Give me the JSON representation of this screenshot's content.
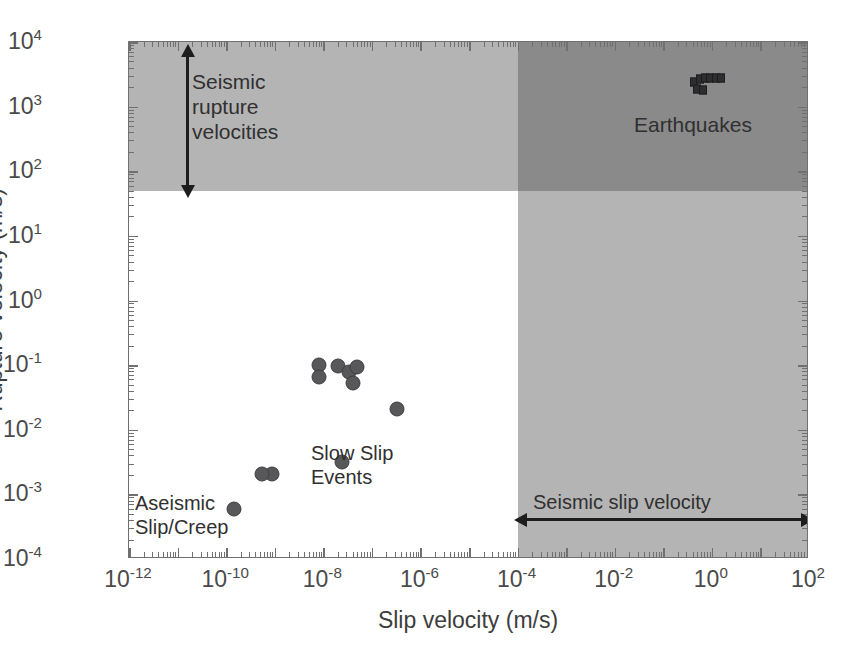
{
  "chart_data": {
    "type": "scatter",
    "title": "",
    "xlabel": "Slip velocity (m/s)",
    "ylabel": "Rupture velocity (m/s)",
    "xscale": "log",
    "yscale": "log",
    "xlim": [
      1e-12,
      100.0
    ],
    "ylim": [
      0.0001,
      10000.0
    ],
    "grid": false,
    "legend": "none",
    "xticks": [
      "10-12",
      "10-10",
      "10-8",
      "10-6",
      "10-4",
      "10-2",
      "100",
      "102"
    ],
    "xtick_labels": [
      {
        "mantissa": "10",
        "exponent": "-12",
        "log10": -12
      },
      {
        "mantissa": "10",
        "exponent": "-10",
        "log10": -10
      },
      {
        "mantissa": "10",
        "exponent": "-8",
        "log10": -8
      },
      {
        "mantissa": "10",
        "exponent": "-6",
        "log10": -6
      },
      {
        "mantissa": "10",
        "exponent": "-4",
        "log10": -4
      },
      {
        "mantissa": "10",
        "exponent": "-2",
        "log10": -2
      },
      {
        "mantissa": "10",
        "exponent": "0",
        "log10": 0
      },
      {
        "mantissa": "10",
        "exponent": "2",
        "log10": 2
      }
    ],
    "ytick_labels": [
      {
        "mantissa": "10",
        "exponent": "4",
        "log10": 4
      },
      {
        "mantissa": "10",
        "exponent": "3",
        "log10": 3
      },
      {
        "mantissa": "10",
        "exponent": "2",
        "log10": 2
      },
      {
        "mantissa": "10",
        "exponent": "1",
        "log10": 1
      },
      {
        "mantissa": "10",
        "exponent": "0",
        "log10": 0
      },
      {
        "mantissa": "10",
        "exponent": "-1",
        "log10": -1
      },
      {
        "mantissa": "10",
        "exponent": "-2",
        "log10": -2
      },
      {
        "mantissa": "10",
        "exponent": "-3",
        "log10": -3
      },
      {
        "mantissa": "10",
        "exponent": "-4",
        "log10": -4
      }
    ],
    "series": [
      {
        "name": "Slow Slip Events",
        "marker": "circle",
        "color": "#58585a",
        "points": [
          {
            "x_log10": -8.09,
            "y_log10": -1.0
          },
          {
            "x_log10": -8.09,
            "y_log10": -1.19
          },
          {
            "x_log10": -7.7,
            "y_log10": -1.02
          },
          {
            "x_log10": -7.47,
            "y_log10": -1.1
          },
          {
            "x_log10": -7.31,
            "y_log10": -1.03
          },
          {
            "x_log10": -7.39,
            "y_log10": -1.28
          },
          {
            "x_log10": -6.48,
            "y_log10": -1.68
          },
          {
            "x_log10": -7.61,
            "y_log10": -2.5
          },
          {
            "x_log10": -9.05,
            "y_log10": -2.69
          },
          {
            "x_log10": -9.26,
            "y_log10": -2.68
          },
          {
            "x_log10": -9.84,
            "y_log10": -3.23
          }
        ]
      },
      {
        "name": "Earthquakes",
        "marker": "square",
        "color": "#2e2e30",
        "points": [
          {
            "x_log10": -0.37,
            "y_log10": 3.38
          },
          {
            "x_log10": -0.25,
            "y_log10": 3.43
          },
          {
            "x_log10": -0.15,
            "y_log10": 3.45
          },
          {
            "x_log10": -0.04,
            "y_log10": 3.45
          },
          {
            "x_log10": 0.08,
            "y_log10": 3.45
          },
          {
            "x_log10": 0.19,
            "y_log10": 3.44
          },
          {
            "x_log10": -0.31,
            "y_log10": 3.27
          },
          {
            "x_log10": -0.19,
            "y_log10": 3.26
          }
        ]
      }
    ],
    "regions": [
      {
        "name": "seismic-rupture-velocity-band",
        "orientation": "horizontal",
        "y_range_log10": [
          1.69,
          4
        ],
        "color": "#b4b4b4",
        "label": "Seismic\nrupture\nvelocities"
      },
      {
        "name": "seismic-slip-velocity-band",
        "orientation": "vertical",
        "x_range_log10": [
          -4,
          2
        ],
        "color": "#b4b4b4",
        "label": "Seismic slip velocity"
      },
      {
        "name": "overlap-band",
        "orientation": "both",
        "x_range_log10": [
          -4,
          2
        ],
        "y_range_log10": [
          1.69,
          4
        ],
        "color": "#8a8a8a",
        "label": ""
      }
    ],
    "annotations": [
      {
        "name": "seismic-rupture-velocities",
        "text": "Seismic\nrupture\nvelocities",
        "x_log10": -10.6,
        "y_log10": 3.0
      },
      {
        "name": "earthquakes",
        "text": "Earthquakes",
        "x_log10": -0.9,
        "y_log10": 2.6
      },
      {
        "name": "slow-slip-events",
        "text": "Slow Slip\nEvents",
        "x_log10": -8.2,
        "y_log10": -1.9
      },
      {
        "name": "aseismic-slip-creep",
        "text": "Aseismic\nSlip/Creep",
        "x_log10": -11.5,
        "y_log10": -2.7
      },
      {
        "name": "seismic-slip-velocity",
        "text": "Seismic slip velocity",
        "x_log10": -1.0,
        "y_log10": -2.65
      }
    ],
    "arrows": [
      {
        "name": "rupture-velocity-range-arrow",
        "orientation": "vertical",
        "double_headed": true,
        "x_log10": -10.8,
        "y_start_log10": 1.75,
        "y_end_log10": 3.78
      },
      {
        "name": "slip-velocity-range-arrow",
        "orientation": "horizontal",
        "double_headed": true,
        "y_log10": -3.15,
        "x_start_log10": -3.9,
        "x_end_log10": 1.8
      }
    ]
  },
  "axes": {
    "x_title": "Slip velocity (m/s)",
    "y_title": "Rupture velocity (m/s)"
  },
  "labels": {
    "seismic_rupture_line1": "Seismic",
    "seismic_rupture_line2": "rupture",
    "seismic_rupture_line3": "velocities",
    "earthquakes": "Earthquakes",
    "slow_slip_line1": "Slow Slip",
    "slow_slip_line2": "Events",
    "aseismic_line1": "Aseismic",
    "aseismic_line2": "Slip/Creep",
    "seismic_slip_velocity": "Seismic slip velocity"
  },
  "colors": {
    "band_light": "#b4b4b4",
    "band_dark": "#8a8a8a",
    "circle_marker": "#58585a",
    "square_marker": "#2e2e30",
    "axis": "#707070",
    "text": "#3a3a3a",
    "background": "#ffffff"
  }
}
